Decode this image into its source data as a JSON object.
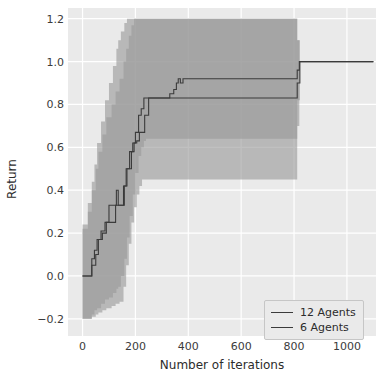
{
  "chart_data": {
    "type": "line",
    "title": "",
    "xlabel": "Number of iterations",
    "ylabel": "Return",
    "xlim": [
      -55,
      1110
    ],
    "ylim": [
      -0.28,
      1.25
    ],
    "xticks": [
      0,
      200,
      400,
      600,
      800,
      1000
    ],
    "yticks": [
      -0.2,
      0.0,
      0.2,
      0.4,
      0.6,
      0.8,
      1.0,
      1.2
    ],
    "xtick_labels": [
      "0",
      "200",
      "400",
      "600",
      "800",
      "1000"
    ],
    "ytick_labels": [
      "−0.2",
      "0.0",
      "0.2",
      "0.4",
      "0.6",
      "0.8",
      "1.0",
      "1.2"
    ],
    "grid": true,
    "legend_position": "lower right",
    "colors": {
      "line": "#3b3b3b",
      "band": "#9a9a9a",
      "band_overlap": "#808080",
      "plot_background": "#eaeaea",
      "grid": "#ffffff",
      "figure_background": "#ffffff",
      "tick_text": "#3b3b3b"
    },
    "series": [
      {
        "name": "12 Agents",
        "x": [
          0,
          20,
          35,
          50,
          60,
          75,
          90,
          110,
          125,
          140,
          155,
          165,
          175,
          185,
          195,
          205,
          215,
          225,
          235,
          250,
          265,
          300,
          330,
          345,
          355,
          362,
          370,
          380,
          500,
          700,
          805,
          812,
          820,
          1100
        ],
        "values": [
          0.0,
          0.0,
          0.05,
          0.1,
          0.17,
          0.2,
          0.25,
          0.25,
          0.33,
          0.33,
          0.42,
          0.5,
          0.5,
          0.58,
          0.62,
          0.63,
          0.67,
          0.67,
          0.75,
          0.83,
          0.83,
          0.83,
          0.85,
          0.87,
          0.9,
          0.92,
          0.9,
          0.92,
          0.92,
          0.92,
          0.92,
          0.96,
          1.0,
          1.0
        ],
        "band_lower": [
          -0.2,
          -0.2,
          -0.19,
          -0.18,
          -0.17,
          -0.16,
          -0.15,
          -0.14,
          -0.13,
          -0.12,
          -0.05,
          0.05,
          0.15,
          0.25,
          0.32,
          0.38,
          0.42,
          0.45,
          0.45,
          0.45,
          0.45,
          0.45,
          0.45,
          0.45,
          0.45,
          0.45,
          0.45,
          0.45,
          0.45,
          0.45,
          0.45,
          0.7,
          1.0,
          1.0
        ],
        "band_upper": [
          0.22,
          0.3,
          0.4,
          0.5,
          0.58,
          0.66,
          0.74,
          0.8,
          0.86,
          0.92,
          1.0,
          1.06,
          1.12,
          1.17,
          1.2,
          1.2,
          1.2,
          1.2,
          1.2,
          1.2,
          1.2,
          1.2,
          1.2,
          1.2,
          1.2,
          1.2,
          1.2,
          1.2,
          1.2,
          1.2,
          1.2,
          1.1,
          1.0,
          1.0
        ]
      },
      {
        "name": "6 Agents",
        "x": [
          0,
          20,
          35,
          45,
          55,
          70,
          85,
          100,
          115,
          128,
          135,
          145,
          158,
          168,
          178,
          190,
          200,
          212,
          222,
          232,
          240,
          248,
          400,
          600,
          800,
          812,
          822,
          1100
        ],
        "values": [
          0.0,
          0.0,
          0.08,
          0.12,
          0.17,
          0.21,
          0.25,
          0.33,
          0.33,
          0.4,
          0.33,
          0.33,
          0.42,
          0.5,
          0.58,
          0.62,
          0.67,
          0.75,
          0.78,
          0.83,
          0.83,
          0.83,
          0.83,
          0.83,
          0.83,
          0.9,
          1.0,
          1.0
        ],
        "band_lower": [
          -0.2,
          -0.2,
          -0.18,
          -0.16,
          -0.15,
          -0.13,
          -0.11,
          -0.1,
          -0.08,
          -0.06,
          -0.05,
          0.0,
          0.08,
          0.18,
          0.28,
          0.38,
          0.48,
          0.56,
          0.6,
          0.63,
          0.64,
          0.64,
          0.64,
          0.64,
          0.64,
          0.82,
          1.0,
          1.0
        ],
        "band_upper": [
          0.24,
          0.34,
          0.44,
          0.52,
          0.62,
          0.72,
          0.82,
          0.9,
          0.98,
          1.06,
          1.1,
          1.14,
          1.18,
          1.2,
          1.2,
          1.2,
          1.2,
          1.2,
          1.2,
          1.2,
          1.2,
          1.2,
          1.2,
          1.2,
          1.2,
          1.1,
          1.0,
          1.0
        ]
      }
    ]
  },
  "legend": {
    "items": [
      {
        "label": "12 Agents"
      },
      {
        "label": "6 Agents"
      }
    ]
  },
  "axes": {
    "xlabel": "Number of iterations",
    "ylabel": "Return"
  }
}
